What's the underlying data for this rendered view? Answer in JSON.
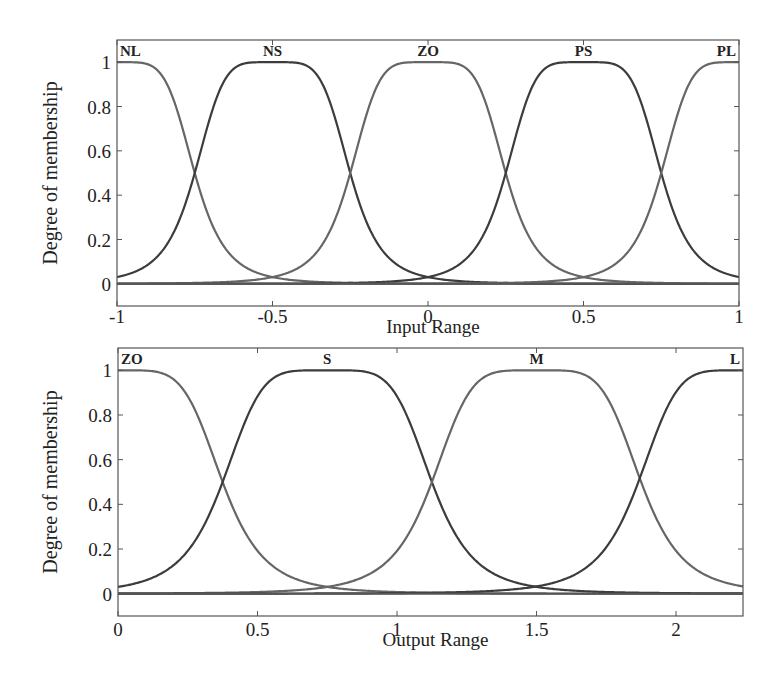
{
  "chart_data": [
    {
      "type": "line",
      "title": "",
      "xlabel": "Input Range",
      "ylabel": "Degree of membership",
      "xlim": [
        -1,
        1
      ],
      "ylim": [
        -0.1,
        1.1
      ],
      "xticks": [
        -1,
        -0.5,
        0,
        0.5,
        1
      ],
      "xtick_labels": [
        "-1",
        "-0.5",
        "0",
        "0.5",
        "1"
      ],
      "yticks": [
        0,
        0.2,
        0.4,
        0.6,
        0.8,
        1
      ],
      "ytick_labels": [
        "0",
        "0.2",
        "0.4",
        "0.6",
        "0.8",
        "1"
      ],
      "grid": false,
      "membership_function": "generalized bell",
      "series": [
        {
          "name": "NL",
          "center": -1.0,
          "a": 0.25,
          "b": 2.5
        },
        {
          "name": "NS",
          "center": -0.5,
          "a": 0.25,
          "b": 2.5
        },
        {
          "name": "ZO",
          "center": 0.0,
          "a": 0.25,
          "b": 2.5
        },
        {
          "name": "PS",
          "center": 0.5,
          "a": 0.25,
          "b": 2.5
        },
        {
          "name": "PL",
          "center": 1.0,
          "a": 0.25,
          "b": 2.5
        }
      ],
      "crossings_at_0.5": [
        -0.75,
        -0.25,
        0.25,
        0.75
      ]
    },
    {
      "type": "line",
      "title": "",
      "xlabel": "Output Range",
      "ylabel": "Degree of membership",
      "xlim": [
        0,
        2.24
      ],
      "ylim": [
        -0.1,
        1.1
      ],
      "xticks": [
        0,
        0.5,
        1,
        1.5,
        2
      ],
      "xtick_labels": [
        "0",
        "0.5",
        "1",
        "1.5",
        "2"
      ],
      "yticks": [
        0,
        0.2,
        0.4,
        0.6,
        0.8,
        1
      ],
      "ytick_labels": [
        "0",
        "0.2",
        "0.4",
        "0.6",
        "0.8",
        "1"
      ],
      "grid": false,
      "membership_function": "generalized bell",
      "series": [
        {
          "name": "ZO",
          "center": 0.0,
          "a": 0.375,
          "b": 2.5
        },
        {
          "name": "S",
          "center": 0.75,
          "a": 0.375,
          "b": 2.5
        },
        {
          "name": "M",
          "center": 1.5,
          "a": 0.375,
          "b": 2.5
        },
        {
          "name": "L",
          "center": 2.24,
          "a": 0.375,
          "b": 2.5
        }
      ],
      "crossings_at_0.5": [
        0.37,
        1.12,
        1.88
      ]
    }
  ]
}
